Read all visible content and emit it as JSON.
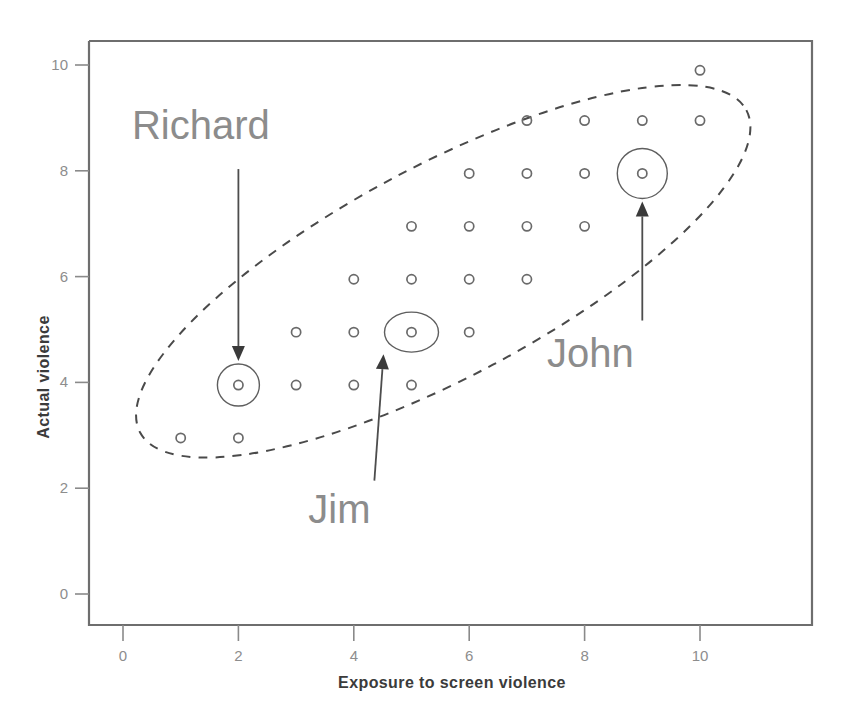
{
  "chart_data": {
    "type": "scatter",
    "title": "",
    "xlabel": "Exposure to screen violence",
    "ylabel": "Actual violence",
    "xlim": [
      -0.55,
      10.9
    ],
    "ylim": [
      -0.75,
      10.65
    ],
    "grid": false,
    "legend": "none",
    "xticks": [
      "0",
      "2",
      "4",
      "6",
      "8",
      "10"
    ],
    "xtick_values": [
      0,
      2,
      4,
      6,
      8,
      10
    ],
    "yticks": [
      "0",
      "2",
      "4",
      "6",
      "8",
      "10"
    ],
    "ytick_values": [
      0,
      2,
      4,
      6,
      8,
      10
    ],
    "points": [
      {
        "x": 1,
        "y": 3
      },
      {
        "x": 2,
        "y": 3
      },
      {
        "x": 2,
        "y": 4
      },
      {
        "x": 3,
        "y": 4
      },
      {
        "x": 4,
        "y": 4
      },
      {
        "x": 5,
        "y": 4
      },
      {
        "x": 3,
        "y": 5
      },
      {
        "x": 4,
        "y": 5
      },
      {
        "x": 5,
        "y": 5
      },
      {
        "x": 6,
        "y": 5
      },
      {
        "x": 4,
        "y": 6
      },
      {
        "x": 5,
        "y": 6
      },
      {
        "x": 6,
        "y": 6
      },
      {
        "x": 7,
        "y": 6
      },
      {
        "x": 5,
        "y": 7
      },
      {
        "x": 6,
        "y": 7
      },
      {
        "x": 7,
        "y": 7
      },
      {
        "x": 8,
        "y": 7
      },
      {
        "x": 6,
        "y": 8
      },
      {
        "x": 7,
        "y": 8
      },
      {
        "x": 8,
        "y": 8
      },
      {
        "x": 9,
        "y": 8
      },
      {
        "x": 7,
        "y": 9
      },
      {
        "x": 8,
        "y": 9
      },
      {
        "x": 9,
        "y": 9
      },
      {
        "x": 10,
        "y": 9
      },
      {
        "x": 10,
        "y": 10
      }
    ],
    "annotations": [
      {
        "label": "Richard",
        "point": {
          "x": 2,
          "y": 4
        },
        "label_position": {
          "x": 1.35,
          "y": 8.6
        },
        "ring": "circle"
      },
      {
        "label": "Jim",
        "point": {
          "x": 5,
          "y": 5
        },
        "label_position": {
          "x": 3.75,
          "y": 1.35
        },
        "ring": "ellipse"
      },
      {
        "label": "John",
        "point": {
          "x": 9,
          "y": 8
        },
        "label_position": {
          "x": 8.1,
          "y": 4.3
        },
        "ring": "circle"
      }
    ],
    "envelope": {
      "shape": "dashed-ellipse",
      "description": "dashed ellipse enclosing the positively correlated cloud",
      "center": {
        "x": 5.55,
        "y": 6.1
      },
      "rx": 5.95,
      "ry": 2.0,
      "rotation_deg": -28
    }
  },
  "colors": {
    "point_stroke": "#6a6a6a",
    "frame": "#6e6e6e",
    "tick_label": "#8d8d8d",
    "axis_title": "#3b3b3b",
    "callout_label": "#8c8c8c",
    "envelope": "#4a4a4a",
    "background": "#ffffff"
  }
}
